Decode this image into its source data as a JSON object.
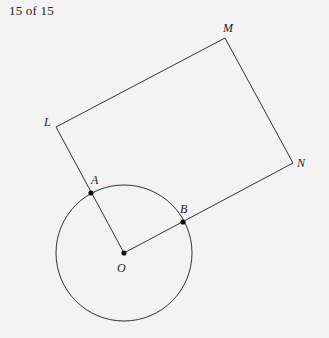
{
  "header": {
    "page_counter": "15 of 15"
  },
  "diagram": {
    "stroke_color": "#333333",
    "background": "#f3f3f3",
    "circle": {
      "center": "O",
      "cx": 124,
      "cy": 253,
      "r": 68
    },
    "points": {
      "O": {
        "label": "O",
        "x": 124,
        "y": 253
      },
      "A": {
        "label": "A",
        "x": 91,
        "y": 193
      },
      "B": {
        "label": "B",
        "x": 183,
        "y": 222
      },
      "L": {
        "label": "L",
        "x": 56,
        "y": 127
      },
      "M": {
        "label": "M",
        "x": 225,
        "y": 38
      },
      "N": {
        "label": "N",
        "x": 293,
        "y": 163
      }
    },
    "segments": [
      "O-L",
      "L-M",
      "M-N",
      "N-O"
    ],
    "marked_points": [
      "A",
      "B",
      "O"
    ],
    "shape": "rectangle OLMN with circle centered at O intersecting OL at A and ON at B"
  }
}
